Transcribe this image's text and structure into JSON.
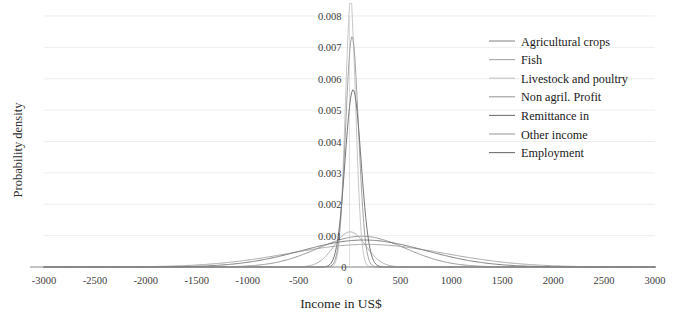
{
  "chart_data": {
    "type": "line",
    "title": "",
    "xlabel": "Income in US$",
    "ylabel": "Probability density",
    "xlim": [
      -3000,
      3000
    ],
    "ylim": [
      0,
      0.008
    ],
    "xticks": [
      -3000,
      -2500,
      -2000,
      -1500,
      -1000,
      -500,
      0,
      500,
      1000,
      1500,
      2000,
      2500,
      3000
    ],
    "xtick_labels": [
      "-3000",
      "-2500",
      "-2000",
      "-1500",
      "-1000",
      "-500",
      "0",
      "500",
      "1000",
      "1500",
      "2000",
      "2500",
      "3000"
    ],
    "yticks": [
      0,
      0.001,
      0.002,
      0.003,
      0.004,
      0.005,
      0.006,
      0.007,
      0.008
    ],
    "ytick_labels": [
      "0",
      "0.001",
      "0.002",
      "0.003",
      "0.004",
      "0.005",
      "0.006",
      "0.007",
      "0.008"
    ],
    "grid": true,
    "grid_axis": "y",
    "legend_position": "top-right",
    "series": [
      {
        "name": "Agricultural crops",
        "color": "#8c8c8c",
        "width": 0.9,
        "kernel": "gaussian",
        "mean": 120,
        "sigma": 430,
        "peak": 0.00098
      },
      {
        "name": "Fish",
        "color": "#a8a8a8",
        "width": 0.9,
        "kernel": "gaussian",
        "mean": 5,
        "sigma": 155,
        "peak": 0.00112
      },
      {
        "name": "Livestock and poultry",
        "color": "#c2c2c2",
        "width": 0.9,
        "kernel": "gaussian",
        "mean": 10,
        "sigma": 52,
        "peak": 0.0083
      },
      {
        "name": "Non agril. Profit",
        "color": "#9a9a9a",
        "width": 0.9,
        "kernel": "gaussian",
        "mean": 25,
        "sigma": 63,
        "peak": 0.00735
      },
      {
        "name": "Remittance in",
        "color": "#777777",
        "width": 1.0,
        "kernel": "gaussian",
        "mean": 35,
        "sigma": 78,
        "peak": 0.00565
      },
      {
        "name": "Other income",
        "color": "#9e9e9e",
        "width": 0.9,
        "kernel": "gaussian",
        "mean": 170,
        "sigma": 760,
        "peak": 0.00072
      },
      {
        "name": "Employment",
        "color": "#6f6f6f",
        "width": 0.9,
        "kernel": "gaussian",
        "mean": 140,
        "sigma": 610,
        "peak": 0.00086
      }
    ]
  },
  "legend": {
    "items": [
      "Agricultural crops",
      "Fish",
      "Livestock and poultry",
      "Non agril. Profit",
      "Remittance in",
      "Other income",
      "Employment"
    ]
  },
  "colors": {
    "background": "#ffffff",
    "axis": "#8a8a8a",
    "grid": "#e6e6e6",
    "text": "#1f1f1f"
  }
}
